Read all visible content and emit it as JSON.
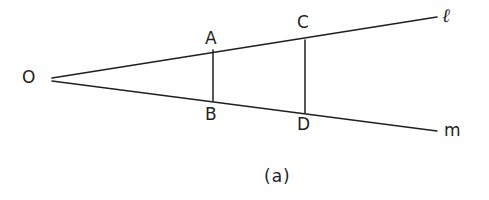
{
  "figure": {
    "caption": "(a)",
    "background_color": "#ffffff",
    "stroke_color": "#1f1f1f",
    "text_color": "#1f1f1f",
    "vertex": {
      "name": "O",
      "label": "O",
      "x": 52,
      "y": 79,
      "label_x": 22,
      "label_y": 69
    },
    "rays": [
      {
        "name": "ray-l",
        "label": "ℓ",
        "from_x": 52,
        "from_y": 78,
        "to_x": 437,
        "to_y": 17,
        "label_x": 442,
        "label_y": 6
      },
      {
        "name": "ray-m",
        "label": "m",
        "from_x": 52,
        "from_y": 81,
        "to_x": 437,
        "to_y": 131,
        "label_x": 444,
        "label_y": 122
      }
    ],
    "transversals": [
      {
        "name": "segment-AB",
        "top_label": "A",
        "bottom_label": "B",
        "x": 213,
        "top_y": 50,
        "bottom_y": 101,
        "top_label_x": 205,
        "top_label_y": 30,
        "bottom_label_x": 205,
        "bottom_label_y": 106
      },
      {
        "name": "segment-CD",
        "top_label": "C",
        "bottom_label": "D",
        "x": 305,
        "top_y": 40,
        "bottom_y": 113,
        "top_label_x": 297,
        "top_label_y": 14,
        "bottom_label_x": 297,
        "bottom_label_y": 116
      }
    ],
    "caption_x": 264,
    "caption_y": 168
  }
}
